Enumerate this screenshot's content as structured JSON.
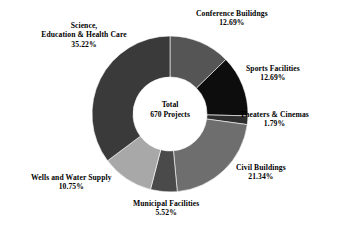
{
  "chart_data": {
    "type": "pie",
    "variant": "donut",
    "title": "",
    "subtitle": "",
    "xlabel": "",
    "ylabel": "",
    "legend_position": "none",
    "grid": false,
    "center_label": {
      "line1": "Total",
      "line2": "670 Projects",
      "total_value": 670,
      "total_unit": "Projects"
    },
    "value_unit": "percent",
    "categories": [
      "Conference Builidngs",
      "Sports Facilities",
      "Theaters & Cinemas",
      "Civil Buildings",
      "Municipal Facilities",
      "Wells and Water Supply",
      "Science, Education & Health Care"
    ],
    "values": [
      12.69,
      12.69,
      1.79,
      21.34,
      5.52,
      10.75,
      35.22
    ],
    "slices": [
      {
        "label": "Conference Builidngs",
        "label_lines": [
          "Conference Builidngs"
        ],
        "percent_text": "12.69%",
        "value": 12.69,
        "color": "#555555",
        "start_angle": 0,
        "end_angle": 45.684
      },
      {
        "label": "Sports Facilities",
        "label_lines": [
          "Sports Facilities"
        ],
        "percent_text": "12.69%",
        "value": 12.69,
        "color": "#0d0d0d",
        "start_angle": 45.684,
        "end_angle": 91.368
      },
      {
        "label": "Theaters & Cinemas",
        "label_lines": [
          "Theaters & Cinemas"
        ],
        "percent_text": "1.79%",
        "value": 1.79,
        "color": "#2e2e2e",
        "start_angle": 91.368,
        "end_angle": 97.812
      },
      {
        "label": "Civil Buildings",
        "label_lines": [
          "Civil Buildings"
        ],
        "percent_text": "21.34%",
        "value": 21.34,
        "color": "#6e6e6e",
        "start_angle": 97.812,
        "end_angle": 174.636
      },
      {
        "label": "Municipal Facilities",
        "label_lines": [
          "Municipal Facilities"
        ],
        "percent_text": "5.52%",
        "value": 5.52,
        "color": "#4a4a4a",
        "start_angle": 174.636,
        "end_angle": 194.508
      },
      {
        "label": "Wells and Water Supply",
        "label_lines": [
          "Wells and Water Supply"
        ],
        "percent_text": "10.75%",
        "value": 10.75,
        "color": "#a8a8a8",
        "start_angle": 194.508,
        "end_angle": 233.208
      },
      {
        "label": "Science, Education & Health Care",
        "label_lines": [
          "Science,",
          "Education & Health Care"
        ],
        "percent_text": "35.22%",
        "value": 35.22,
        "color": "#3a3a3a",
        "start_angle": 233.208,
        "end_angle": 360
      }
    ]
  },
  "labels": {
    "conference": {
      "line1": "Conference Builidngs",
      "percent": "12.69%"
    },
    "sports": {
      "line1": "Sports Facilities",
      "percent": "12.69%"
    },
    "theaters": {
      "line1": "Theaters & Cinemas",
      "percent": "1.79%"
    },
    "civil": {
      "line1": "Civil Buildings",
      "percent": "21.34%"
    },
    "municipal": {
      "line1": "Municipal Facilities",
      "percent": "5.52%"
    },
    "wells": {
      "line1": "Wells and Water Supply",
      "percent": "10.75%"
    },
    "science": {
      "line1": "Science,",
      "line2": "Education & Health Care",
      "percent": "35.22%"
    }
  },
  "center": {
    "line1": "Total",
    "line2": "670 Projects"
  },
  "colors": {
    "background": "#ffffff",
    "text": "#000000"
  }
}
